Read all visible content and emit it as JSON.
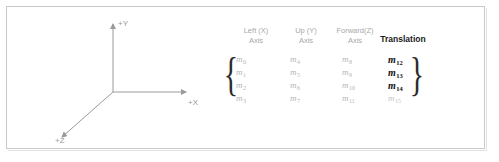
{
  "figure": {
    "diagram": {
      "axis_labels": {
        "y": "+Y",
        "x": "+X",
        "z": "+Z"
      },
      "axis_color": "#9a9a9a"
    },
    "matrix": {
      "headers": [
        {
          "line1": "Left (X)",
          "line2": "Axis",
          "emphasis": false
        },
        {
          "line1": "Up (Y)",
          "line2": "Axis",
          "emphasis": false
        },
        {
          "line1": "Forward(Z)",
          "line2": "Axis",
          "emphasis": false
        },
        {
          "line1": "Translation",
          "line2": "",
          "emphasis": true
        }
      ],
      "open_brace": "{",
      "close_brace": "}",
      "rows": [
        [
          {
            "base": "m",
            "sub": "0"
          },
          {
            "base": "m",
            "sub": "4"
          },
          {
            "base": "m",
            "sub": "8"
          },
          {
            "base": "m",
            "sub": "12",
            "emphasis": true
          }
        ],
        [
          {
            "base": "m",
            "sub": "1"
          },
          {
            "base": "m",
            "sub": "5"
          },
          {
            "base": "m",
            "sub": "9"
          },
          {
            "base": "m",
            "sub": "13",
            "emphasis": true
          }
        ],
        [
          {
            "base": "m",
            "sub": "2"
          },
          {
            "base": "m",
            "sub": "6"
          },
          {
            "base": "m",
            "sub": "10"
          },
          {
            "base": "m",
            "sub": "14",
            "emphasis": true
          }
        ],
        [
          {
            "base": "m",
            "sub": "3"
          },
          {
            "base": "m",
            "sub": "7"
          },
          {
            "base": "m",
            "sub": "11"
          },
          {
            "base": "m",
            "sub": "15",
            "emphasis": false
          }
        ]
      ],
      "emphasis_color": "#111111",
      "faint_color": "#b4b4b4"
    }
  }
}
